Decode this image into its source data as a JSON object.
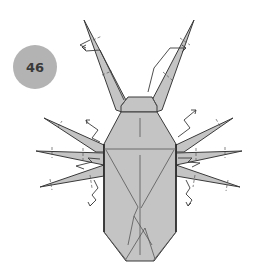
{
  "step": {
    "number": "46"
  },
  "diagram": {
    "colors": {
      "paper": "#c4c4c4",
      "line": "#3a3a3a",
      "badge": "#b3b3b3",
      "badge_text": "#3a3a3a"
    },
    "parts": [
      "antenna-left",
      "antenna-right",
      "head",
      "thorax",
      "abdomen",
      "leg-left-1",
      "leg-left-2",
      "leg-left-3",
      "leg-right-1",
      "leg-right-2",
      "leg-right-3"
    ],
    "symbols": [
      "valley-fold-tick",
      "zigzag-arrow",
      "thin-arrow"
    ]
  }
}
